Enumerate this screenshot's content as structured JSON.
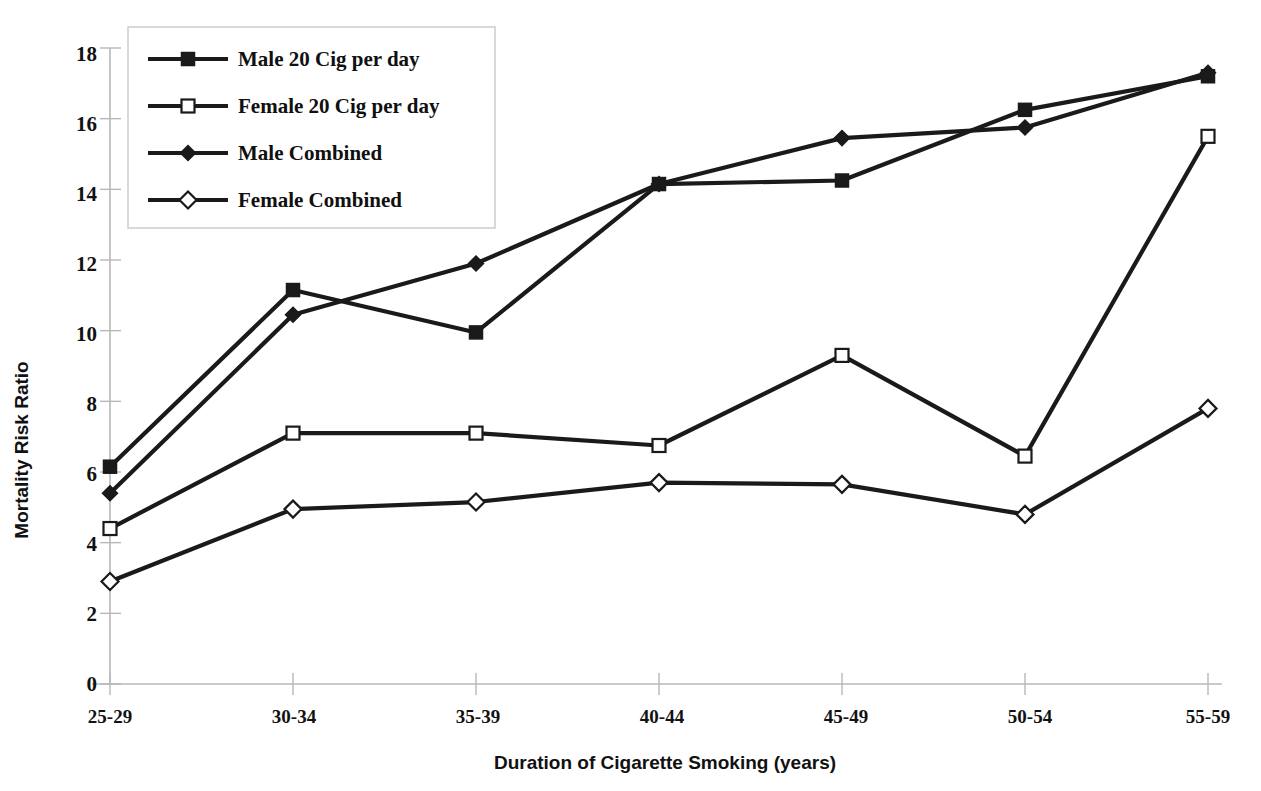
{
  "chart_data": {
    "type": "line",
    "title": "",
    "xlabel": "Duration of Cigarette Smoking (years)",
    "ylabel": "Mortality Risk Ratio",
    "categories": [
      "25-29",
      "30-34",
      "35-39",
      "40-44",
      "45-49",
      "50-54",
      "55-59"
    ],
    "ylim": [
      0,
      18
    ],
    "yticks": [
      0,
      2,
      4,
      6,
      8,
      10,
      12,
      14,
      16,
      18
    ],
    "ytick_labels": [
      "0",
      "2",
      "4",
      "6",
      "8",
      "10",
      "12",
      "14",
      "16",
      "18"
    ],
    "grid": false,
    "legend_position": "top-left",
    "series": [
      {
        "name": "Male 20 Cig per day",
        "marker": "filled-square",
        "color": "#1a1a1a",
        "values": [
          6.15,
          11.15,
          9.95,
          14.15,
          14.25,
          16.25,
          17.2
        ]
      },
      {
        "name": "Female 20 Cig per day",
        "marker": "open-square",
        "color": "#1a1a1a",
        "values": [
          4.4,
          7.1,
          7.1,
          6.75,
          9.3,
          6.45,
          15.5
        ]
      },
      {
        "name": "Male Combined",
        "marker": "filled-diamond",
        "color": "#1a1a1a",
        "values": [
          5.4,
          10.45,
          11.9,
          14.15,
          15.45,
          15.75,
          17.3
        ]
      },
      {
        "name": "Female Combined",
        "marker": "open-diamond",
        "color": "#1a1a1a",
        "values": [
          2.9,
          4.95,
          5.15,
          5.7,
          5.65,
          4.8,
          7.8
        ]
      }
    ]
  },
  "axis": {
    "y_title": "Mortality Risk Ratio",
    "x_title": "Duration of Cigarette Smoking (years)",
    "y_tick_0": "0",
    "y_tick_2": "2",
    "y_tick_4": "4",
    "y_tick_6": "6",
    "y_tick_8": "8",
    "y_tick_10": "10",
    "y_tick_12": "12",
    "y_tick_14": "14",
    "y_tick_16": "16",
    "y_tick_18": "18",
    "x_cat_0": "25-29",
    "x_cat_1": "30-34",
    "x_cat_2": "35-39",
    "x_cat_3": "40-44",
    "x_cat_4": "45-49",
    "x_cat_5": "50-54",
    "x_cat_6": "55-59"
  },
  "legend": {
    "item_0": "Male 20 Cig per day",
    "item_1": "Female 20 Cig per day",
    "item_2": "Male Combined",
    "item_3": "Female Combined"
  },
  "colors": {
    "series_line": "#1a1a1a",
    "axis_line": "#b8b8b8",
    "legend_border": "#c9c9c9",
    "background": "#ffffff",
    "marker_fill_open": "#ffffff"
  }
}
